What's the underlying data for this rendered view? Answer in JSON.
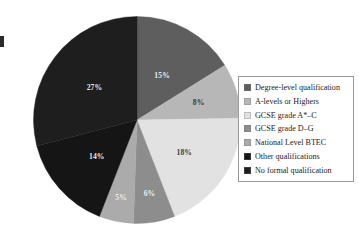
{
  "chart_data": {
    "type": "pie",
    "title": "",
    "subtitle": "",
    "xlabel": "",
    "ylabel": "",
    "grid": false,
    "legend_position": "right",
    "units": "percent",
    "start_angle_deg": 0,
    "direction": "clockwise",
    "categories": [
      "Degree-level qualification",
      "A-levels or Highers",
      "GCSE grade A*–C",
      "GCSE grade D–G",
      "National Level BTEC",
      "Other qualifications",
      "No formal qualification"
    ],
    "values": [
      15,
      8,
      18,
      6,
      5,
      14,
      27
    ],
    "data_labels": [
      "15%",
      "8%",
      "18%",
      "6%",
      "5%",
      "14%",
      "27%"
    ],
    "colors": [
      "#5e5e5e",
      "#b7b7b7",
      "#e2e2e2",
      "#8d8d8d",
      "#ababab",
      "#151515",
      "#1e1e1e"
    ],
    "slices": [
      {
        "label": "Degree-level qualification",
        "value": 15,
        "data_label": "15%",
        "color": "#5e5e5e",
        "label_fill": "on-mid"
      },
      {
        "label": "A-levels or Highers",
        "value": 8,
        "data_label": "8%",
        "color": "#b7b7b7",
        "label_fill": "on-light"
      },
      {
        "label": "GCSE grade A*–C",
        "value": 18,
        "data_label": "18%",
        "color": "#e2e2e2",
        "label_fill": "on-light"
      },
      {
        "label": "GCSE grade D–G",
        "value": 6,
        "data_label": "6%",
        "color": "#8d8d8d",
        "label_fill": "on-mid"
      },
      {
        "label": "National Level BTEC",
        "value": 5,
        "data_label": "5%",
        "color": "#ababab",
        "label_fill": "on-mid"
      },
      {
        "label": "Other qualifications",
        "value": 14,
        "data_label": "14%",
        "color": "#151515",
        "label_fill": "on-dark"
      },
      {
        "label": "No formal qualification",
        "value": 27,
        "data_label": "27%",
        "color": "#1e1e1e",
        "label_fill": "on-dark"
      }
    ]
  },
  "legend": {
    "items": [
      {
        "label": "Degree-level qualification",
        "color": "#5e5e5e"
      },
      {
        "label": "A-levels or Highers",
        "color": "#b7b7b7"
      },
      {
        "label": "GCSE grade A*–C",
        "color": "#e2e2e2"
      },
      {
        "label": "GCSE grade D–G",
        "color": "#8d8d8d"
      },
      {
        "label": "National Level BTEC",
        "color": "#ababab"
      },
      {
        "label": "Other qualifications",
        "color": "#151515"
      },
      {
        "label": "No formal qualification",
        "color": "#1e1e1e"
      }
    ]
  }
}
